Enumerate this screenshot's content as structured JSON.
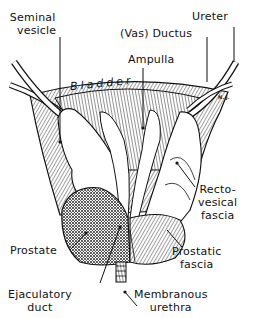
{
  "figure": {
    "type": "anatomical illustration",
    "signature": "N. J.",
    "labels": {
      "seminal_vesicle": [
        "Seminal",
        "vesicle"
      ],
      "vas_ductus": "(Vas) Ductus",
      "ureter": "Ureter",
      "ampulla": "Ampulla",
      "bladder": "Bladder",
      "rectovesical_fascia": [
        "Recto-",
        "vesical",
        "fascia"
      ],
      "prostate": "Prostate",
      "prostatic_fascia": [
        "Prostatic",
        "fascia"
      ],
      "ejaculatory_duct": [
        "Ejaculatory",
        "duct"
      ],
      "membranous_urethra": [
        "Membranous",
        "urethra"
      ]
    }
  }
}
